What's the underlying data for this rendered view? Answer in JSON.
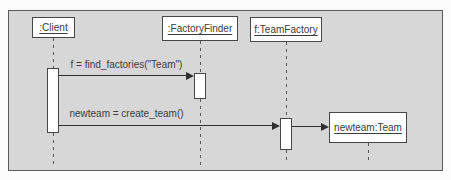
{
  "diagram": {
    "kind": "uml-sequence-diagram",
    "objects": [
      {
        "label": ":Client"
      },
      {
        "label": ":FactoryFinder"
      },
      {
        "label": "f:TeamFactory"
      },
      {
        "label": "newteam:Team"
      }
    ],
    "messages": [
      {
        "label": "f = find_factories(\"Team\")",
        "from": ":Client",
        "to": ":FactoryFinder"
      },
      {
        "label": "newteam = create_team()",
        "from": ":Client",
        "to": "f:TeamFactory"
      },
      {
        "from": "f:TeamFactory",
        "to": "newteam:Team"
      }
    ],
    "colors": {
      "frame_background": "#d7d7d7",
      "box_background": "#ffffff",
      "stroke": "#3f3f3f"
    }
  }
}
